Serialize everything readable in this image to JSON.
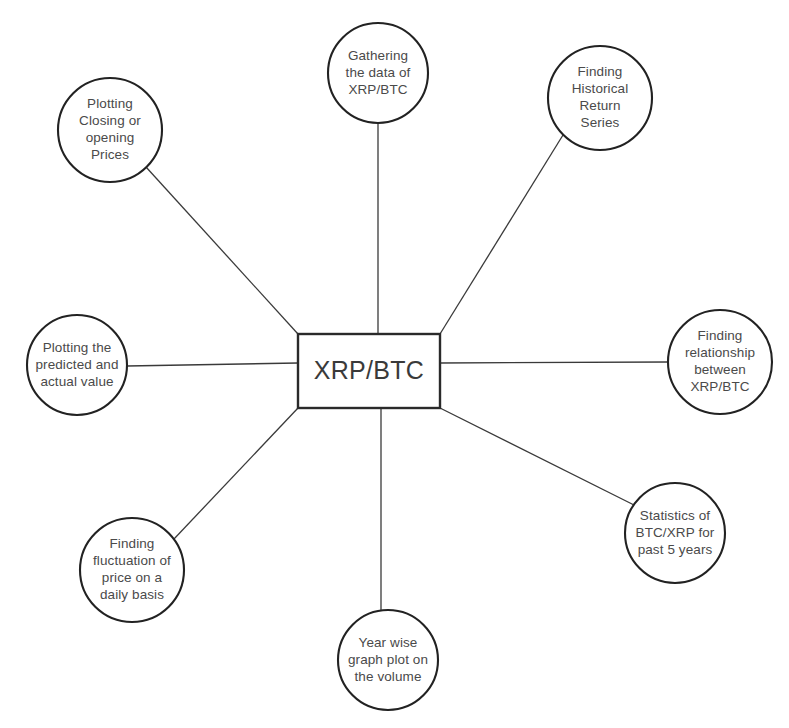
{
  "diagram": {
    "type": "hub-and-spoke",
    "title": "XRP/BTC",
    "background_color": "#ffffff",
    "stroke_color": "#222222",
    "text_color": "#4a4a4a",
    "hub": {
      "label": "XRP/BTC",
      "shape": "rectangle",
      "x": 298,
      "y": 334,
      "width": 142,
      "height": 74
    },
    "nodes": [
      {
        "id": "gathering-data",
        "shape": "circle",
        "cx": 378,
        "cy": 73,
        "r": 50,
        "lines": [
          "Gathering",
          "the data of",
          "XRP/BTC"
        ],
        "connector": {
          "x1": 378,
          "y1": 123,
          "x2": 378,
          "y2": 334
        }
      },
      {
        "id": "historical-return-series",
        "shape": "circle",
        "cx": 600,
        "cy": 98,
        "r": 52,
        "lines": [
          "Finding",
          "Historical",
          "Return",
          "Series"
        ],
        "connector": {
          "x1": 563,
          "y1": 135,
          "x2": 440,
          "y2": 334
        }
      },
      {
        "id": "plotting-closing-opening-prices",
        "shape": "circle",
        "cx": 110,
        "cy": 130,
        "r": 52,
        "lines": [
          "Plotting",
          "Closing or",
          "opening",
          "Prices"
        ],
        "connector": {
          "x1": 146,
          "y1": 167,
          "x2": 298,
          "y2": 334
        }
      },
      {
        "id": "finding-relationship",
        "shape": "circle",
        "cx": 720,
        "cy": 362,
        "r": 52,
        "lines": [
          "Finding",
          "relationship",
          "between",
          "XRP/BTC"
        ],
        "connector": {
          "x1": 668,
          "y1": 362,
          "x2": 440,
          "y2": 363
        }
      },
      {
        "id": "plotting-predicted-actual",
        "shape": "circle",
        "cx": 77,
        "cy": 365,
        "r": 50,
        "lines": [
          "Plotting the",
          "predicted and",
          "actual value"
        ],
        "connector": {
          "x1": 127,
          "y1": 366,
          "x2": 298,
          "y2": 363
        }
      },
      {
        "id": "statistics-past-5-years",
        "shape": "circle",
        "cx": 675,
        "cy": 533,
        "r": 50,
        "lines": [
          "Statistics of",
          "BTC/XRP for",
          "past 5 years"
        ],
        "connector": {
          "x1": 634,
          "y1": 505,
          "x2": 440,
          "y2": 408
        }
      },
      {
        "id": "finding-fluctuation-daily",
        "shape": "circle",
        "cx": 132,
        "cy": 570,
        "r": 52,
        "lines": [
          "Finding",
          "fluctuation of",
          "price on a",
          "daily basis"
        ],
        "connector": {
          "x1": 174,
          "y1": 539,
          "x2": 298,
          "y2": 408
        }
      },
      {
        "id": "year-wise-graph-volume",
        "shape": "circle",
        "cx": 388,
        "cy": 660,
        "r": 50,
        "lines": [
          "Year wise",
          "graph plot on",
          "the volume"
        ],
        "connector": {
          "x1": 381,
          "y1": 610,
          "x2": 381,
          "y2": 408
        }
      }
    ]
  }
}
